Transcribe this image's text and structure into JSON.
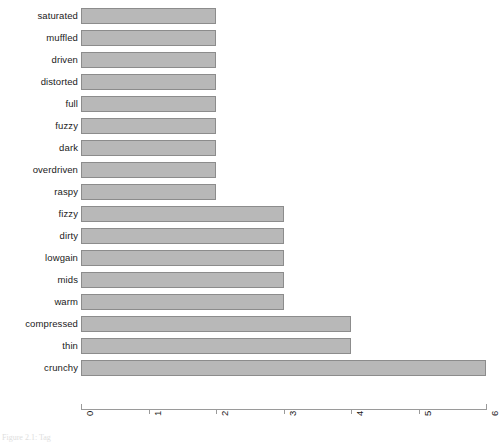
{
  "chart_data": {
    "type": "bar",
    "orientation": "horizontal",
    "title": "",
    "xlabel": "",
    "ylabel": "",
    "categories": [
      "saturated",
      "muffled",
      "driven",
      "distorted",
      "full",
      "fuzzy",
      "dark",
      "overdriven",
      "raspy",
      "fizzy",
      "dirty",
      "lowgain",
      "mids",
      "warm",
      "compressed",
      "thin",
      "crunchy"
    ],
    "values": [
      2,
      2,
      2,
      2,
      2,
      2,
      2,
      2,
      2,
      3,
      3,
      3,
      3,
      3,
      4,
      4,
      6
    ],
    "xlim": [
      0,
      6
    ],
    "xticks": [
      0,
      1,
      2,
      3,
      4,
      5,
      6
    ],
    "xticklabels": [
      "0",
      "1",
      "2",
      "3",
      "4",
      "5",
      "6"
    ],
    "xtick_rotation": 90,
    "grid": false,
    "legend": false,
    "bar_color": "#b8b8b8",
    "bar_edge_color": "#8c8c8c",
    "axis_color": "#9a9a9a"
  },
  "caption": {
    "text": "Figure 2.1: Tag",
    "visible": "partial"
  }
}
